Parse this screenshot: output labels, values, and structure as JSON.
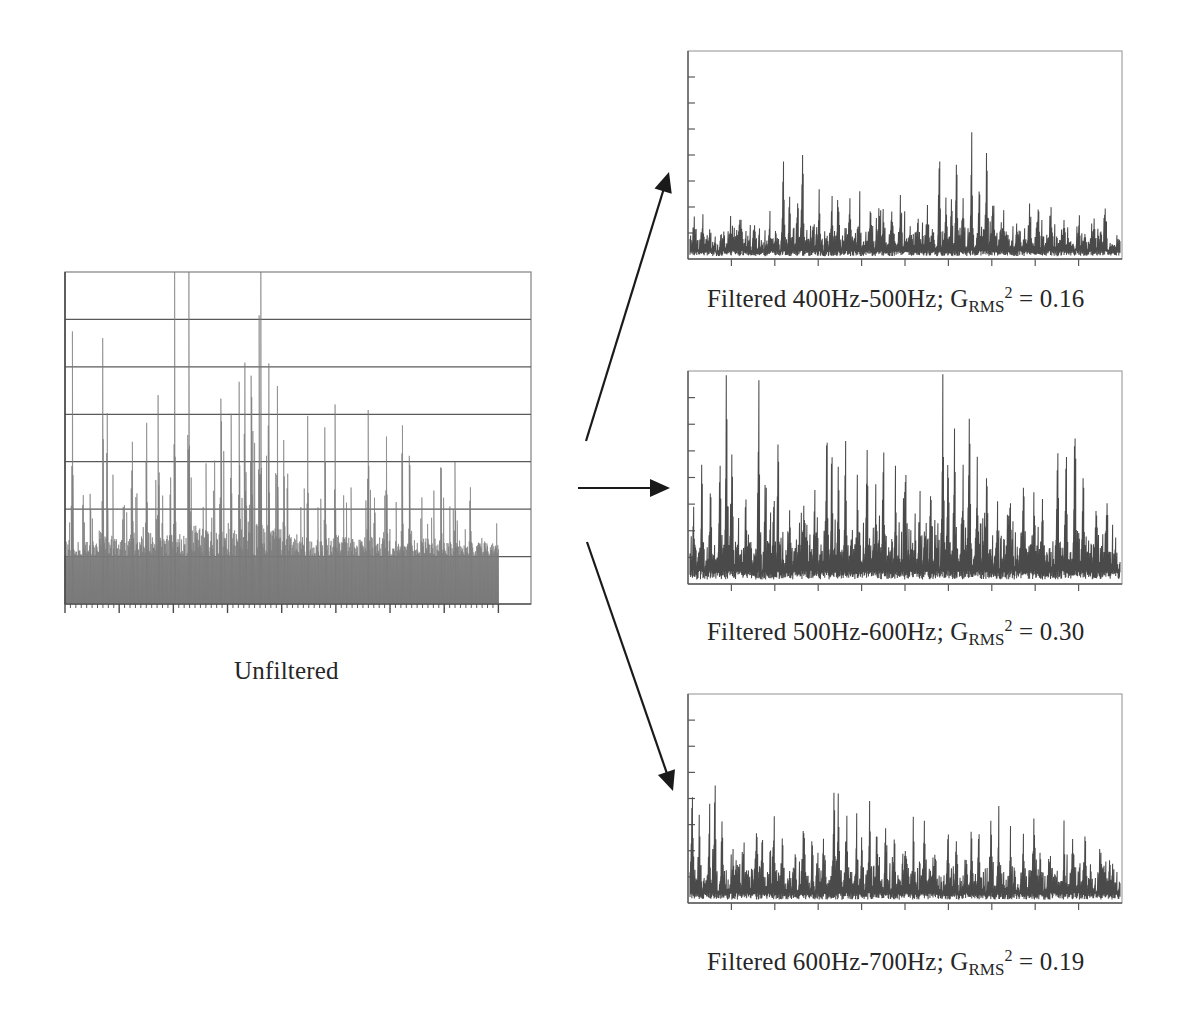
{
  "figure": {
    "title_unfiltered": "Unfiltered",
    "background": "#ffffff",
    "line_color": "#4a4a4a",
    "fill_color": "#7a7a7a",
    "axis_color": "#8a8a8a",
    "grid_color": "#5a5a5a",
    "arrow_color": "#1a1a1a"
  },
  "captions": {
    "unfiltered": "Unfiltered",
    "band1_prefix": "Filtered 400Hz-500Hz; G",
    "band1_sub": "RMS",
    "band1_sup": "2",
    "band1_suffix": "= 0.16",
    "band2_prefix": "Filtered 500Hz-600Hz; G",
    "band2_sub": "RMS",
    "band2_sup": "2",
    "band2_suffix": "= 0.30",
    "band3_prefix": "Filtered 600Hz-700Hz; G",
    "band3_sub": "RMS",
    "band3_sup": "2",
    "band3_suffix": "= 0.19"
  },
  "chart_data": [
    {
      "type": "area",
      "name": "unfiltered",
      "title": "Unfiltered",
      "xlabel": "",
      "ylabel": "",
      "grid": true,
      "gridlines": 6,
      "xlim": [
        0,
        1000
      ],
      "ylim": [
        0,
        1
      ],
      "x_major_ticks": 8,
      "x_minor_per_major": 10,
      "data_fraction": 0.93,
      "seed": 1771,
      "n_points": 760,
      "envelope": [
        0.42,
        0.47,
        0.4,
        0.44,
        0.52,
        0.58,
        0.5,
        0.46,
        0.55,
        0.62,
        0.7,
        0.66,
        0.58,
        0.63,
        0.72,
        0.86,
        0.78,
        0.7,
        0.74,
        0.8,
        0.88,
        0.95,
        0.9,
        0.82,
        0.76,
        0.68,
        0.6,
        0.55,
        0.5,
        0.47,
        0.52,
        0.58,
        0.5,
        0.45,
        0.48,
        0.56,
        0.5,
        0.44,
        0.4,
        0.42,
        0.46,
        0.52,
        0.48,
        0.42,
        0.38,
        0.36,
        0.4,
        0.44,
        0.38,
        0.34
      ],
      "baseline_fill": 0.14,
      "peaks": [
        {
          "x": 0.017,
          "y": 0.745
        },
        {
          "x": 0.087,
          "y": 0.57
        },
        {
          "x": 0.097,
          "y": 0.565
        },
        {
          "x": 0.155,
          "y": 0.49
        },
        {
          "x": 0.188,
          "y": 0.505
        },
        {
          "x": 0.215,
          "y": 0.505
        },
        {
          "x": 0.253,
          "y": 0.845
        },
        {
          "x": 0.286,
          "y": 0.905
        },
        {
          "x": 0.36,
          "y": 0.545
        },
        {
          "x": 0.383,
          "y": 0.505
        },
        {
          "x": 0.402,
          "y": 0.555
        },
        {
          "x": 0.415,
          "y": 0.56
        },
        {
          "x": 0.43,
          "y": 0.795
        },
        {
          "x": 0.448,
          "y": 0.725
        },
        {
          "x": 0.452,
          "y": 0.65
        },
        {
          "x": 0.47,
          "y": 0.73
        },
        {
          "x": 0.49,
          "y": 0.5
        },
        {
          "x": 0.505,
          "y": 0.47
        },
        {
          "x": 0.56,
          "y": 0.415
        },
        {
          "x": 0.6,
          "y": 0.56
        },
        {
          "x": 0.623,
          "y": 0.48
        },
        {
          "x": 0.7,
          "y": 0.56
        },
        {
          "x": 0.742,
          "y": 0.405
        },
        {
          "x": 0.778,
          "y": 0.48
        },
        {
          "x": 0.795,
          "y": 0.425
        },
        {
          "x": 0.868,
          "y": 0.32
        },
        {
          "x": 0.9,
          "y": 0.3
        },
        {
          "x": 0.935,
          "y": 0.29
        }
      ]
    },
    {
      "type": "line",
      "name": "filtered_400_500",
      "title": "Filtered 400Hz-500Hz; G_RMS^2 = 0.16",
      "xlabel": "",
      "ylabel": "",
      "grid": false,
      "xlim": [
        0,
        1000
      ],
      "ylim": [
        0,
        1
      ],
      "y_ticks": 8,
      "x_major_ticks": 10,
      "grms2": 0.16,
      "band_low_hz": 400,
      "band_high_hz": 500,
      "seed": 4093,
      "n_points": 700,
      "noise_floor": 0.055,
      "envelope": [
        0.1,
        0.13,
        0.11,
        0.09,
        0.12,
        0.1,
        0.13,
        0.11,
        0.1,
        0.14,
        0.12,
        0.1,
        0.13,
        0.11,
        0.15,
        0.13,
        0.11,
        0.1,
        0.13,
        0.12,
        0.11,
        0.14,
        0.12,
        0.1,
        0.13,
        0.15,
        0.12,
        0.11,
        0.14,
        0.12,
        0.1,
        0.13,
        0.11,
        0.15,
        0.13,
        0.12,
        0.14,
        0.11,
        0.1,
        0.12,
        0.13,
        0.11,
        0.1,
        0.12,
        0.11,
        0.13,
        0.1,
        0.12,
        0.11,
        0.1
      ],
      "peaks": [
        {
          "x": 0.01,
          "y": 0.12
        },
        {
          "x": 0.03,
          "y": 0.155
        },
        {
          "x": 0.095,
          "y": 0.12
        },
        {
          "x": 0.115,
          "y": 0.175
        },
        {
          "x": 0.15,
          "y": 0.14
        },
        {
          "x": 0.185,
          "y": 0.12
        },
        {
          "x": 0.217,
          "y": 0.48
        },
        {
          "x": 0.232,
          "y": 0.27
        },
        {
          "x": 0.25,
          "y": 0.255
        },
        {
          "x": 0.262,
          "y": 0.5
        },
        {
          "x": 0.3,
          "y": 0.13
        },
        {
          "x": 0.33,
          "y": 0.275
        },
        {
          "x": 0.344,
          "y": 0.235
        },
        {
          "x": 0.372,
          "y": 0.215
        },
        {
          "x": 0.395,
          "y": 0.135
        },
        {
          "x": 0.42,
          "y": 0.2
        },
        {
          "x": 0.44,
          "y": 0.185
        },
        {
          "x": 0.45,
          "y": 0.16
        },
        {
          "x": 0.47,
          "y": 0.19
        },
        {
          "x": 0.49,
          "y": 0.215
        },
        {
          "x": 0.53,
          "y": 0.15
        },
        {
          "x": 0.552,
          "y": 0.175
        },
        {
          "x": 0.58,
          "y": 0.47
        },
        {
          "x": 0.595,
          "y": 0.225
        },
        {
          "x": 0.608,
          "y": 0.25
        },
        {
          "x": 0.62,
          "y": 0.5
        },
        {
          "x": 0.635,
          "y": 0.23
        },
        {
          "x": 0.655,
          "y": 0.48
        },
        {
          "x": 0.672,
          "y": 0.255
        },
        {
          "x": 0.69,
          "y": 0.5
        },
        {
          "x": 0.705,
          "y": 0.18
        },
        {
          "x": 0.73,
          "y": 0.15
        },
        {
          "x": 0.76,
          "y": 0.135
        },
        {
          "x": 0.79,
          "y": 0.18
        },
        {
          "x": 0.81,
          "y": 0.215
        },
        {
          "x": 0.84,
          "y": 0.16
        },
        {
          "x": 0.87,
          "y": 0.135
        },
        {
          "x": 0.905,
          "y": 0.145
        },
        {
          "x": 0.94,
          "y": 0.155
        },
        {
          "x": 0.965,
          "y": 0.14
        }
      ]
    },
    {
      "type": "line",
      "name": "filtered_500_600",
      "title": "Filtered 500Hz-600Hz; G_RMS^2 = 0.30",
      "xlabel": "",
      "ylabel": "",
      "grid": false,
      "xlim": [
        0,
        1000
      ],
      "ylim": [
        0,
        1
      ],
      "y_ticks": 8,
      "x_major_ticks": 10,
      "grms2": 0.3,
      "band_low_hz": 500,
      "band_high_hz": 600,
      "seed": 9137,
      "n_points": 700,
      "noise_floor": 0.085,
      "envelope": [
        0.18,
        0.22,
        0.19,
        0.17,
        0.21,
        0.18,
        0.22,
        0.2,
        0.18,
        0.23,
        0.2,
        0.18,
        0.22,
        0.19,
        0.24,
        0.21,
        0.19,
        0.18,
        0.22,
        0.2,
        0.19,
        0.23,
        0.21,
        0.18,
        0.22,
        0.24,
        0.2,
        0.19,
        0.23,
        0.2,
        0.18,
        0.22,
        0.19,
        0.24,
        0.21,
        0.2,
        0.23,
        0.19,
        0.18,
        0.21,
        0.22,
        0.19,
        0.18,
        0.21,
        0.19,
        0.22,
        0.18,
        0.21,
        0.19,
        0.18
      ],
      "peaks": [
        {
          "x": 0.008,
          "y": 0.2
        },
        {
          "x": 0.028,
          "y": 0.37
        },
        {
          "x": 0.048,
          "y": 0.31
        },
        {
          "x": 0.07,
          "y": 0.5
        },
        {
          "x": 0.085,
          "y": 0.93
        },
        {
          "x": 0.098,
          "y": 0.56
        },
        {
          "x": 0.13,
          "y": 0.3
        },
        {
          "x": 0.16,
          "y": 0.88
        },
        {
          "x": 0.175,
          "y": 0.44
        },
        {
          "x": 0.195,
          "y": 0.38
        },
        {
          "x": 0.205,
          "y": 0.49
        },
        {
          "x": 0.232,
          "y": 0.3
        },
        {
          "x": 0.265,
          "y": 0.33
        },
        {
          "x": 0.29,
          "y": 0.26
        },
        {
          "x": 0.318,
          "y": 0.64
        },
        {
          "x": 0.33,
          "y": 0.53
        },
        {
          "x": 0.345,
          "y": 0.505
        },
        {
          "x": 0.362,
          "y": 0.58
        },
        {
          "x": 0.39,
          "y": 0.32
        },
        {
          "x": 0.412,
          "y": 0.48
        },
        {
          "x": 0.432,
          "y": 0.34
        },
        {
          "x": 0.45,
          "y": 0.53
        },
        {
          "x": 0.478,
          "y": 0.33
        },
        {
          "x": 0.5,
          "y": 0.49
        },
        {
          "x": 0.535,
          "y": 0.3
        },
        {
          "x": 0.56,
          "y": 0.4
        },
        {
          "x": 0.588,
          "y": 0.88
        },
        {
          "x": 0.6,
          "y": 0.46
        },
        {
          "x": 0.615,
          "y": 0.62
        },
        {
          "x": 0.635,
          "y": 0.48
        },
        {
          "x": 0.65,
          "y": 0.81
        },
        {
          "x": 0.668,
          "y": 0.42
        },
        {
          "x": 0.69,
          "y": 0.47
        },
        {
          "x": 0.715,
          "y": 0.33
        },
        {
          "x": 0.745,
          "y": 0.3
        },
        {
          "x": 0.775,
          "y": 0.4
        },
        {
          "x": 0.8,
          "y": 0.34
        },
        {
          "x": 0.82,
          "y": 0.38
        },
        {
          "x": 0.855,
          "y": 0.61
        },
        {
          "x": 0.875,
          "y": 0.58
        },
        {
          "x": 0.895,
          "y": 0.75
        },
        {
          "x": 0.915,
          "y": 0.44
        },
        {
          "x": 0.945,
          "y": 0.32
        },
        {
          "x": 0.97,
          "y": 0.29
        }
      ]
    },
    {
      "type": "line",
      "name": "filtered_600_700",
      "title": "Filtered 600Hz-700Hz; G_RMS^2 = 0.19",
      "xlabel": "",
      "ylabel": "",
      "grid": false,
      "xlim": [
        0,
        1000
      ],
      "ylim": [
        0,
        1
      ],
      "y_ticks": 8,
      "x_major_ticks": 10,
      "grms2": 0.19,
      "band_low_hz": 600,
      "band_high_hz": 700,
      "seed": 6421,
      "n_points": 700,
      "noise_floor": 0.065,
      "envelope": [
        0.13,
        0.16,
        0.14,
        0.12,
        0.15,
        0.13,
        0.16,
        0.14,
        0.12,
        0.17,
        0.15,
        0.13,
        0.16,
        0.14,
        0.18,
        0.15,
        0.13,
        0.12,
        0.16,
        0.14,
        0.13,
        0.17,
        0.15,
        0.12,
        0.16,
        0.18,
        0.14,
        0.13,
        0.17,
        0.14,
        0.12,
        0.16,
        0.13,
        0.17,
        0.15,
        0.14,
        0.16,
        0.13,
        0.12,
        0.15,
        0.16,
        0.13,
        0.12,
        0.15,
        0.13,
        0.16,
        0.12,
        0.15,
        0.13,
        0.12
      ],
      "peaks": [
        {
          "x": 0.005,
          "y": 0.51
        },
        {
          "x": 0.022,
          "y": 0.33
        },
        {
          "x": 0.045,
          "y": 0.37
        },
        {
          "x": 0.058,
          "y": 0.6
        },
        {
          "x": 0.075,
          "y": 0.26
        },
        {
          "x": 0.1,
          "y": 0.2
        },
        {
          "x": 0.125,
          "y": 0.18
        },
        {
          "x": 0.155,
          "y": 0.37
        },
        {
          "x": 0.168,
          "y": 0.3
        },
        {
          "x": 0.195,
          "y": 0.31
        },
        {
          "x": 0.215,
          "y": 0.26
        },
        {
          "x": 0.245,
          "y": 0.18
        },
        {
          "x": 0.265,
          "y": 0.3
        },
        {
          "x": 0.285,
          "y": 0.18
        },
        {
          "x": 0.31,
          "y": 0.25
        },
        {
          "x": 0.335,
          "y": 0.52
        },
        {
          "x": 0.345,
          "y": 0.48
        },
        {
          "x": 0.365,
          "y": 0.3
        },
        {
          "x": 0.388,
          "y": 0.285
        },
        {
          "x": 0.4,
          "y": 0.26
        },
        {
          "x": 0.418,
          "y": 0.36
        },
        {
          "x": 0.435,
          "y": 0.28
        },
        {
          "x": 0.455,
          "y": 0.3
        },
        {
          "x": 0.475,
          "y": 0.25
        },
        {
          "x": 0.5,
          "y": 0.225
        },
        {
          "x": 0.52,
          "y": 0.27
        },
        {
          "x": 0.545,
          "y": 0.29
        },
        {
          "x": 0.57,
          "y": 0.2
        },
        {
          "x": 0.6,
          "y": 0.34
        },
        {
          "x": 0.62,
          "y": 0.23
        },
        {
          "x": 0.655,
          "y": 0.29
        },
        {
          "x": 0.672,
          "y": 0.28
        },
        {
          "x": 0.7,
          "y": 0.33
        },
        {
          "x": 0.718,
          "y": 0.32
        },
        {
          "x": 0.745,
          "y": 0.22
        },
        {
          "x": 0.775,
          "y": 0.25
        },
        {
          "x": 0.8,
          "y": 0.3
        },
        {
          "x": 0.835,
          "y": 0.19
        },
        {
          "x": 0.87,
          "y": 0.23
        },
        {
          "x": 0.89,
          "y": 0.28
        },
        {
          "x": 0.92,
          "y": 0.24
        },
        {
          "x": 0.955,
          "y": 0.2
        }
      ]
    }
  ],
  "arrows": [
    {
      "name": "arrow-to-band1",
      "x1": 586,
      "y1": 441,
      "x2": 669,
      "y2": 172
    },
    {
      "name": "arrow-to-band2",
      "x1": 578,
      "y1": 488,
      "x2": 670,
      "y2": 488
    },
    {
      "name": "arrow-to-band3",
      "x1": 587,
      "y1": 542,
      "x2": 673,
      "y2": 791
    }
  ],
  "layout": {
    "panels": [
      {
        "name": "unfiltered-chart",
        "x": 62,
        "y": 271,
        "w": 470,
        "h": 350
      },
      {
        "name": "band1-chart",
        "x": 684,
        "y": 49,
        "w": 440,
        "h": 220
      },
      {
        "name": "band2-chart",
        "x": 684,
        "y": 369,
        "w": 440,
        "h": 225
      },
      {
        "name": "band3-chart",
        "x": 684,
        "y": 692,
        "w": 440,
        "h": 221
      }
    ],
    "captions": [
      {
        "name": "unfiltered-caption",
        "x": 234,
        "y": 657
      },
      {
        "name": "band1-caption",
        "x": 707,
        "y": 285
      },
      {
        "name": "band2-caption",
        "x": 707,
        "y": 618
      },
      {
        "name": "band3-caption",
        "x": 707,
        "y": 948
      }
    ]
  }
}
